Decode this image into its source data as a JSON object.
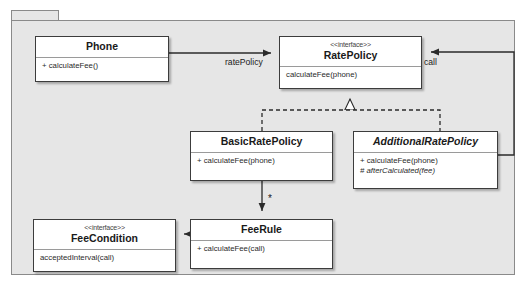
{
  "diagram": {
    "kind": "uml-class-diagram",
    "package": {
      "label": ""
    },
    "colors": {
      "package_fill": "#e6e6e6",
      "package_border": "#8a8a8a",
      "class_fill": "#ffffff",
      "class_border": "#3c3c3c",
      "line": "#2b2b2b",
      "text": "#1a1a1a"
    },
    "classes": [
      {
        "id": "phone",
        "name": "Phone",
        "stereotype": "",
        "abstract": false,
        "members": [
          {
            "text": "+ calculateFee()",
            "abstract": false
          }
        ]
      },
      {
        "id": "ratePolicy",
        "name": "RatePolicy",
        "stereotype": "<<interface>>",
        "abstract": false,
        "members": [
          {
            "text": "calculateFee(phone)",
            "abstract": false
          }
        ]
      },
      {
        "id": "basicRatePolicy",
        "name": "BasicRatePolicy",
        "stereotype": "",
        "abstract": false,
        "members": [
          {
            "text": "+ calculateFee(phone)",
            "abstract": false
          }
        ]
      },
      {
        "id": "additionalRatePolicy",
        "name": "AdditionalRatePolicy",
        "stereotype": "",
        "abstract": true,
        "members": [
          {
            "text": "+ calculateFee(phone)",
            "abstract": false
          },
          {
            "text": "# afterCalculated(fee)",
            "abstract": true
          }
        ]
      },
      {
        "id": "feeCondition",
        "name": "FeeCondition",
        "stereotype": "<<interface>>",
        "abstract": false,
        "members": [
          {
            "text": "acceptedInterval(call)",
            "abstract": false
          }
        ]
      },
      {
        "id": "feeRule",
        "name": "FeeRule",
        "stereotype": "",
        "abstract": false,
        "members": [
          {
            "text": "+ calculateFee(call)",
            "abstract": false
          }
        ]
      }
    ],
    "edges": [
      {
        "id": "phone-ratePolicy",
        "from": "phone",
        "to": "ratePolicy",
        "type": "association",
        "label": "ratePolicy"
      },
      {
        "id": "additional-ratePolicy-call",
        "from": "additionalRatePolicy",
        "to": "ratePolicy",
        "type": "association",
        "label": "call"
      },
      {
        "id": "basic-realizes-ratePolicy",
        "from": "basicRatePolicy",
        "to": "ratePolicy",
        "type": "realization",
        "label": ""
      },
      {
        "id": "additional-realizes-ratePolicy",
        "from": "additionalRatePolicy",
        "to": "ratePolicy",
        "type": "realization",
        "label": ""
      },
      {
        "id": "basic-feeRule",
        "from": "basicRatePolicy",
        "to": "feeRule",
        "type": "association",
        "label": "*"
      },
      {
        "id": "feeRule-feeCondition",
        "from": "feeRule",
        "to": "feeCondition",
        "type": "association",
        "label": ""
      }
    ]
  }
}
